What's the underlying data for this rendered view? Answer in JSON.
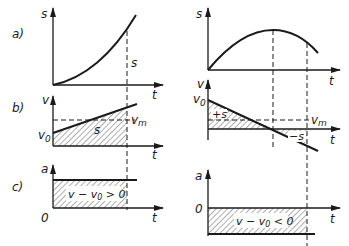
{
  "figure": {
    "row_labels": [
      "a)",
      "b)",
      "c)"
    ],
    "left": {
      "a": {
        "y_label": "s",
        "x_label": "t",
        "annotation": "s"
      },
      "b": {
        "y_label": "v",
        "x_label": "t",
        "v0_label": "v",
        "v0_sub": "0",
        "vm_label": "v",
        "vm_sub": "m",
        "area_label": "s"
      },
      "c": {
        "y_label": "a",
        "x_label": "t",
        "origin_label": "0",
        "area_label_a": "v − v",
        "area_sub": "0",
        "area_label_b": " > 0"
      }
    },
    "right": {
      "a": {
        "y_label": "s",
        "x_label": "t"
      },
      "b": {
        "y_label": "v",
        "x_label": "t",
        "v0_label": "v",
        "v0_sub": "0",
        "vm_label": "v",
        "vm_sub": "m",
        "pos_area_label": "+s",
        "neg_area_label": "−s"
      },
      "c": {
        "y_label": "a",
        "x_label": "t",
        "zero_label": "0",
        "area_label_a": "v − v",
        "area_sub": "0",
        "area_label_b": " < 0"
      }
    }
  }
}
